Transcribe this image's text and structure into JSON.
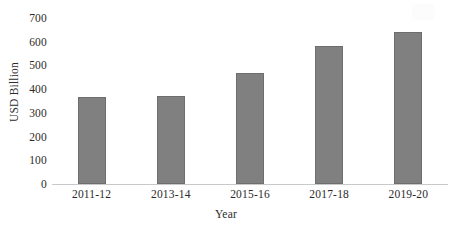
{
  "chart_data": {
    "type": "bar",
    "title": "",
    "subtitle": "",
    "xlabel": "Year",
    "ylabel": "USD Billion",
    "categories": [
      "2011-12",
      "2013-14",
      "2015-16",
      "2017-18",
      "2019-20"
    ],
    "values": [
      367,
      372,
      468,
      582,
      643
    ],
    "series": [
      {
        "name": "USD Billion",
        "values": [
          367,
          372,
          468,
          582,
          643
        ]
      }
    ],
    "ylim": [
      0,
      700
    ],
    "y_ticks": [
      0,
      100,
      200,
      300,
      400,
      500,
      600,
      700
    ],
    "y_tick_labels": [
      "0",
      "100",
      "200",
      "300",
      "400",
      "500",
      "600",
      "700"
    ],
    "grid": false,
    "legend": false,
    "legend_position": "none",
    "bar_color": "#808080",
    "bar_border_color": "#6e6e6e",
    "axis_color": "#c9c9c9",
    "text_color": "#2b2b2b",
    "annotations": []
  }
}
